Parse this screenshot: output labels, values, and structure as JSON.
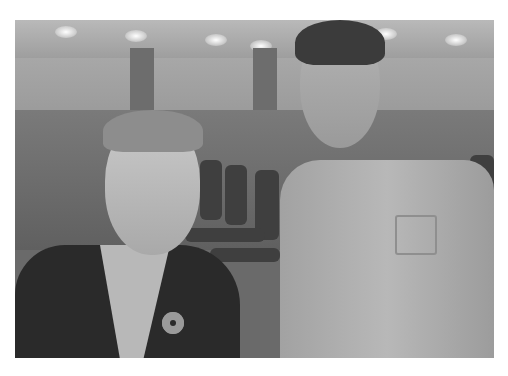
{
  "image": {
    "description": "Grayscale photograph of two people posing in a conference hall: a man in a dark jacket with a ring-shaped lapel pin on the left and a boy in a light collared shirt on the right; rows of chairs and a seated crowd in the background under a lit ceiling.",
    "palette": {
      "background": "#ffffff",
      "jacket": "#2a2a2a",
      "shirt": "#b8b8b8",
      "wall": "#a0a0a0",
      "chairs": "#3f3f3f"
    }
  }
}
